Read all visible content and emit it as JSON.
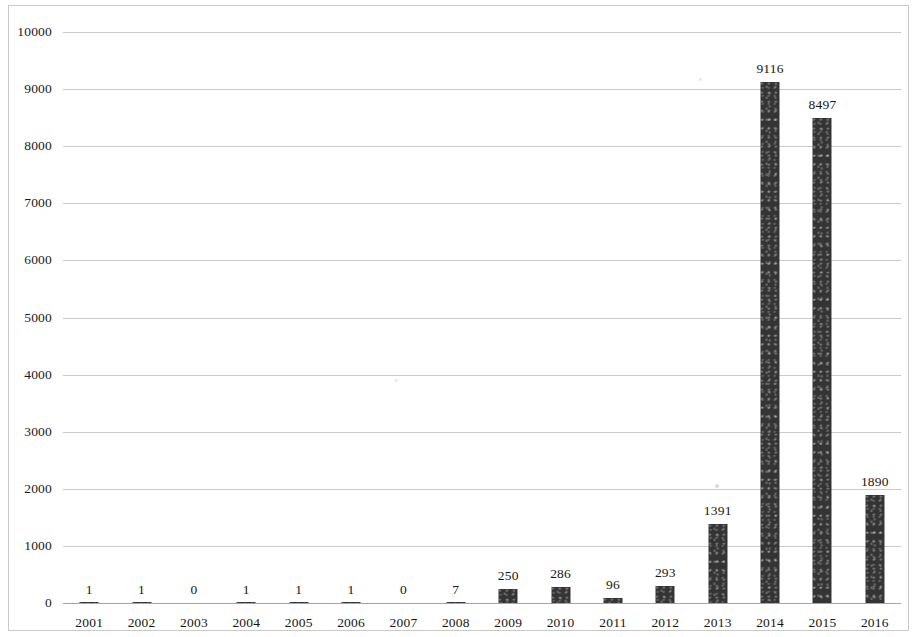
{
  "chart_data": {
    "type": "bar",
    "title": "",
    "subtitle": "",
    "xlabel": "",
    "ylabel": "",
    "categories": [
      "2001",
      "2002",
      "2003",
      "2004",
      "2005",
      "2006",
      "2007",
      "2008",
      "2009",
      "2010",
      "2011",
      "2012",
      "2013",
      "2014",
      "2015",
      "2016"
    ],
    "values": [
      1,
      1,
      0,
      1,
      1,
      1,
      0,
      7,
      250,
      286,
      96,
      293,
      1391,
      9116,
      8497,
      1890
    ],
    "series": [
      {
        "name": "",
        "values": [
          1,
          1,
          0,
          1,
          1,
          1,
          0,
          7,
          250,
          286,
          96,
          293,
          1391,
          9116,
          8497,
          1890
        ]
      }
    ],
    "data_labels": [
      "1",
      "1",
      "0",
      "1",
      "1",
      "1",
      "0",
      "7",
      "250",
      "286",
      "96",
      "293",
      "1391",
      "9116",
      "8497",
      "1890"
    ],
    "ylim": [
      0,
      10000
    ],
    "ytick_labels": [
      "0",
      "1000",
      "2000",
      "3000",
      "4000",
      "5000",
      "6000",
      "7000",
      "8000",
      "9000",
      "10000"
    ],
    "yticks": [
      0,
      1000,
      2000,
      3000,
      4000,
      5000,
      6000,
      7000,
      8000,
      9000,
      10000
    ],
    "grid": true,
    "legend": false,
    "legend_position": "none",
    "bar_color": "#343434",
    "grid_color": "#b8b8b8",
    "axis_color": "#9a9a9a",
    "background_color": "#ffffff"
  }
}
